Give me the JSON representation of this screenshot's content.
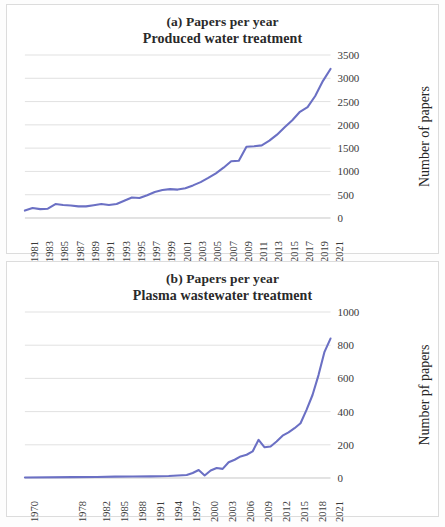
{
  "figure": {
    "background": "#fdfdfd",
    "line_color": "#6b70c4",
    "grid_color": "#d9d9d9"
  },
  "panels": [
    {
      "id": "panel-a",
      "title_line1": "(a) Papers per year",
      "title_line2": "Produced water treatment",
      "xaxis_title": "Year",
      "yaxis_title": "Number of papers",
      "ytick_labels": [
        "3500",
        "3000",
        "2500",
        "2000",
        "1500",
        "1000",
        "500",
        "0"
      ],
      "xtick_labels": [
        "1981",
        "1983",
        "1985",
        "1987",
        "1989",
        "1991",
        "1993",
        "1995",
        "1997",
        "1999",
        "2001",
        "2003",
        "2005",
        "2007",
        "2009",
        "2011",
        "2013",
        "2015",
        "2017",
        "2019",
        "2021"
      ]
    },
    {
      "id": "panel-b",
      "title_line1": "(b) Papers per year",
      "title_line2": "Plasma wastewater treatment",
      "xaxis_title": "Year",
      "yaxis_title": "Number pf papers",
      "ytick_labels": [
        "1000",
        "800",
        "600",
        "400",
        "200",
        "0"
      ],
      "xtick_labels": [
        "1970",
        "1978",
        "1982",
        "1985",
        "1988",
        "1991",
        "1994",
        "1997",
        "2000",
        "2003",
        "2006",
        "2009",
        "2012",
        "2015",
        "2018",
        "2021"
      ]
    }
  ],
  "chart_data": [
    {
      "type": "line",
      "title": "(a) Papers per year — Produced water treatment",
      "xlabel": "Year",
      "ylabel": "Number of papers",
      "ylim": [
        0,
        3500
      ],
      "ytick_step": 500,
      "grid": true,
      "legend": "none",
      "series_color": "#6b70c4",
      "x": [
        1981,
        1982,
        1983,
        1984,
        1985,
        1986,
        1987,
        1988,
        1989,
        1990,
        1991,
        1992,
        1993,
        1994,
        1995,
        1996,
        1997,
        1998,
        1999,
        2000,
        2001,
        2002,
        2003,
        2004,
        2005,
        2006,
        2007,
        2008,
        2009,
        2010,
        2011,
        2012,
        2013,
        2014,
        2015,
        2016,
        2017,
        2018,
        2019,
        2020,
        2021
      ],
      "values": [
        160,
        215,
        190,
        200,
        300,
        280,
        270,
        250,
        250,
        275,
        300,
        280,
        300,
        370,
        440,
        430,
        490,
        560,
        600,
        620,
        610,
        640,
        700,
        770,
        860,
        960,
        1080,
        1220,
        1230,
        1530,
        1540,
        1560,
        1660,
        1790,
        1950,
        2100,
        2280,
        2380,
        2620,
        2940,
        3200
      ]
    },
    {
      "type": "line",
      "title": "(b) Papers per year — Plasma wastewater treatment",
      "xlabel": "Year",
      "ylabel": "Number pf papers",
      "ylim": [
        0,
        1000
      ],
      "ytick_step": 200,
      "grid": true,
      "legend": "none",
      "series_color": "#6b70c4",
      "x": [
        1970,
        1978,
        1982,
        1985,
        1988,
        1991,
        1994,
        1997,
        1998,
        1999,
        2000,
        2001,
        2002,
        2003,
        2004,
        2005,
        2006,
        2007,
        2008,
        2009,
        2010,
        2011,
        2012,
        2013,
        2014,
        2015,
        2016,
        2017,
        2018,
        2019,
        2020,
        2021
      ],
      "values": [
        3,
        5,
        6,
        8,
        9,
        10,
        12,
        18,
        30,
        48,
        15,
        45,
        60,
        55,
        95,
        110,
        130,
        140,
        160,
        230,
        185,
        190,
        220,
        255,
        275,
        300,
        330,
        410,
        500,
        620,
        760,
        840
      ]
    }
  ]
}
